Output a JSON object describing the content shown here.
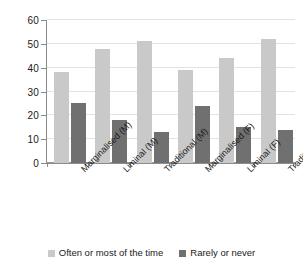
{
  "chart_data": {
    "type": "bar",
    "title": "",
    "subtitle": "",
    "xlabel": "",
    "ylabel": "",
    "ylim": [
      0,
      60
    ],
    "yticks": [
      0,
      10,
      20,
      30,
      40,
      50,
      60
    ],
    "ytick_labels": [
      "0",
      "10",
      "20",
      "30",
      "40",
      "50",
      "60"
    ],
    "grid": true,
    "legend_position": "bottom",
    "categories": [
      "Marginalised (M)",
      "Liminal (M)",
      "Traditional (M)",
      "Marginalised (F)",
      "Liminal (F)",
      "Traditional (F)"
    ],
    "series": [
      {
        "name": "Often or most of the time",
        "color": "#c9c9c9",
        "values": [
          38,
          48,
          51,
          39,
          44,
          52
        ]
      },
      {
        "name": "Rarely or never",
        "color": "#707070",
        "values": [
          25,
          18,
          13,
          24,
          15,
          14
        ]
      }
    ]
  },
  "legend": {
    "items": [
      {
        "label": "Often or most of the time"
      },
      {
        "label": "Rarely or never"
      }
    ]
  },
  "colors": {
    "series_light": "#c9c9c9",
    "series_dark": "#707070",
    "axis": "#8c8c8c",
    "gridline": "#e2e2e2",
    "text": "#1a1a1a",
    "background": "#ffffff"
  }
}
